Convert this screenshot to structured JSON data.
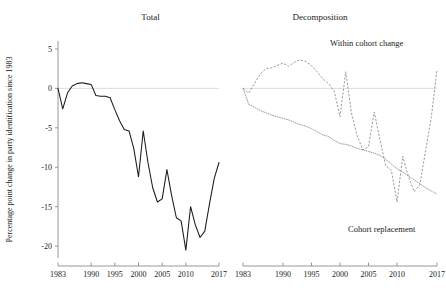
{
  "figure": {
    "ylabel": "Percentage point change in party identification since 1983",
    "background": "#ffffff"
  },
  "panels": {
    "left": {
      "title": "Total",
      "annotations": []
    },
    "right": {
      "title": "Decomposition",
      "annotations": [
        {
          "name": "within-cohort-change",
          "label": "Within cohort change"
        },
        {
          "name": "cohort-replacement",
          "label": "Cohort replacement"
        }
      ]
    }
  },
  "axes": {
    "y": {
      "ticks": [
        5,
        0,
        -5,
        -10,
        -15,
        -20
      ],
      "tick_labels": [
        "5",
        "0",
        "-5",
        "-10",
        "-15",
        "-20"
      ],
      "limits": [
        -21.5,
        6.0
      ],
      "label": "Percentage point change in party identification since 1983"
    },
    "x": {
      "ticks": [
        1983,
        1990,
        1995,
        2000,
        2005,
        2010,
        2017
      ],
      "tick_labels": [
        "1983",
        "1990",
        "1995",
        "2000",
        "2005",
        "2010",
        "2017"
      ],
      "limits": [
        1983,
        2017
      ]
    },
    "zero_reference": 0,
    "colors": {
      "axis": "#8c8c8c",
      "zero_line": "#d8d8d8",
      "total_series": "#1a1a1a",
      "decomposition_series": "#9a9a9a"
    }
  },
  "chart_data": {
    "type": "line",
    "title": "",
    "xlabel": "",
    "ylabel": "Percentage point change in party identification since 1983",
    "xlim": [
      1983,
      2017
    ],
    "ylim": [
      -21.5,
      6.0
    ],
    "grid": false,
    "legend": "annotations-inline",
    "panels": [
      {
        "name": "Total",
        "x": [
          1983,
          1984,
          1985,
          1986,
          1987,
          1988,
          1989,
          1990,
          1991,
          1992,
          1993,
          1994,
          1995,
          1996,
          1997,
          1998,
          1999,
          2000,
          2001,
          2002,
          2003,
          2004,
          2005,
          2006,
          2007,
          2008,
          2009,
          2010,
          2011,
          2012,
          2013,
          2014,
          2015,
          2016,
          2017
        ],
        "series": [
          {
            "name": "Total",
            "style": "solid",
            "color": "#1a1a1a",
            "values": [
              0.0,
              -2.6,
              -0.6,
              0.3,
              0.6,
              0.7,
              0.6,
              0.5,
              -0.9,
              -1.0,
              -1.0,
              -1.2,
              -2.7,
              -4.1,
              -5.2,
              -5.4,
              -7.6,
              -11.2,
              -5.4,
              -9.4,
              -12.6,
              -14.4,
              -14.0,
              -10.3,
              -13.6,
              -16.4,
              -16.8,
              -20.5,
              -15.0,
              -17.3,
              -18.9,
              -18.1,
              -14.6,
              -11.4,
              -9.4
            ]
          }
        ]
      },
      {
        "name": "Decomposition",
        "x": [
          1983,
          1984,
          1985,
          1986,
          1987,
          1988,
          1989,
          1990,
          1991,
          1992,
          1993,
          1994,
          1995,
          1996,
          1997,
          1998,
          1999,
          2000,
          2001,
          2002,
          2003,
          2004,
          2005,
          2006,
          2007,
          2008,
          2009,
          2010,
          2011,
          2012,
          2013,
          2014,
          2015,
          2016,
          2017
        ],
        "series": [
          {
            "name": "Within cohort change",
            "style": "dashed",
            "color": "#9a9a9a",
            "values": [
              0.0,
              -0.6,
              0.6,
              1.8,
              2.5,
              2.6,
              2.9,
              3.2,
              2.8,
              3.3,
              3.6,
              3.4,
              2.9,
              2.1,
              1.2,
              0.6,
              -0.4,
              -3.6,
              2.1,
              -3.1,
              -6.0,
              -7.8,
              -7.4,
              -3.0,
              -6.5,
              -9.8,
              -10.4,
              -14.4,
              -8.6,
              -11.2,
              -13.1,
              -12.2,
              -7.9,
              -3.7,
              2.4
            ]
          },
          {
            "name": "Cohort replacement",
            "style": "dotted",
            "color": "#9a9a9a",
            "values": [
              0.0,
              -2.0,
              -2.4,
              -2.8,
              -3.1,
              -3.4,
              -3.6,
              -3.8,
              -4.0,
              -4.3,
              -4.6,
              -4.8,
              -5.1,
              -5.5,
              -5.9,
              -6.1,
              -6.6,
              -7.0,
              -7.1,
              -7.3,
              -7.6,
              -7.8,
              -8.0,
              -8.2,
              -8.5,
              -9.0,
              -9.6,
              -10.2,
              -10.6,
              -11.1,
              -11.6,
              -12.1,
              -12.6,
              -13.0,
              -13.4
            ]
          }
        ]
      }
    ]
  }
}
